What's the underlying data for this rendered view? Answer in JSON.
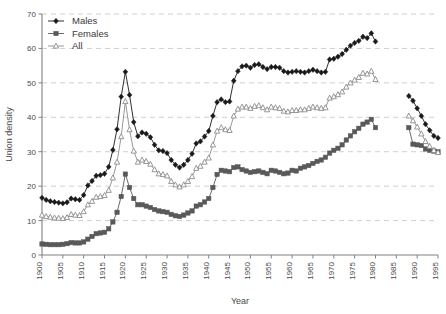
{
  "chart_data": {
    "type": "line",
    "title": "",
    "xlabel": "Year",
    "ylabel": "Union density",
    "xlim": [
      1900,
      1995
    ],
    "ylim": [
      0,
      70
    ],
    "xticks": [
      1900,
      1905,
      1910,
      1915,
      1920,
      1925,
      1930,
      1935,
      1940,
      1945,
      1950,
      1955,
      1960,
      1965,
      1970,
      1975,
      1980,
      1985,
      1990,
      1995
    ],
    "yticks": [
      0,
      10,
      20,
      30,
      40,
      50,
      60,
      70
    ],
    "grid": "horizontal-dashed",
    "legend_position": "top-left",
    "series": [
      {
        "name": "Males",
        "marker": "diamond",
        "color": "#1a1a1a",
        "x": [
          1900,
          1901,
          1902,
          1903,
          1904,
          1905,
          1906,
          1907,
          1908,
          1909,
          1910,
          1911,
          1912,
          1913,
          1914,
          1915,
          1916,
          1917,
          1918,
          1919,
          1920,
          1921,
          1922,
          1923,
          1924,
          1925,
          1926,
          1927,
          1928,
          1929,
          1930,
          1931,
          1932,
          1933,
          1934,
          1935,
          1936,
          1937,
          1938,
          1939,
          1940,
          1941,
          1942,
          1943,
          1944,
          1945,
          1946,
          1947,
          1948,
          1949,
          1950,
          1951,
          1952,
          1953,
          1954,
          1955,
          1956,
          1957,
          1958,
          1959,
          1960,
          1961,
          1962,
          1963,
          1964,
          1965,
          1966,
          1967,
          1968,
          1969,
          1970,
          1971,
          1972,
          1973,
          1974,
          1975,
          1976,
          1977,
          1978,
          1979,
          1980,
          1988,
          1989,
          1990,
          1991,
          1992,
          1993,
          1994,
          1995
        ],
        "values": [
          16.6,
          16.0,
          15.6,
          15.4,
          15.2,
          15.0,
          15.3,
          16.4,
          16.2,
          16.0,
          17.4,
          20.2,
          21.5,
          23.0,
          23.2,
          23.6,
          25.6,
          30.5,
          36.5,
          46.0,
          53.2,
          46.5,
          38.6,
          34.5,
          35.6,
          35.2,
          34.2,
          32.0,
          30.4,
          30.2,
          29.6,
          27.6,
          26.2,
          25.4,
          26.2,
          27.6,
          29.4,
          32.4,
          33.0,
          34.4,
          36.0,
          40.4,
          44.4,
          45.2,
          44.4,
          44.6,
          50.6,
          53.4,
          54.8,
          55.0,
          54.4,
          55.2,
          55.4,
          54.6,
          54.0,
          54.6,
          54.6,
          54.4,
          53.4,
          53.0,
          53.2,
          53.4,
          53.2,
          53.0,
          53.4,
          53.8,
          53.4,
          53.0,
          53.2,
          56.8,
          57.0,
          57.6,
          58.4,
          59.6,
          60.8,
          61.6,
          62.2,
          63.4,
          63.0,
          64.4,
          62.0,
          46.2,
          44.8,
          42.6,
          40.4,
          38.0,
          36.2,
          34.6,
          34.0
        ]
      },
      {
        "name": "Females",
        "marker": "square",
        "color": "#595959",
        "x": [
          1900,
          1901,
          1902,
          1903,
          1904,
          1905,
          1906,
          1907,
          1908,
          1909,
          1910,
          1911,
          1912,
          1913,
          1914,
          1915,
          1916,
          1917,
          1918,
          1919,
          1920,
          1921,
          1922,
          1923,
          1924,
          1925,
          1926,
          1927,
          1928,
          1929,
          1930,
          1931,
          1932,
          1933,
          1934,
          1935,
          1936,
          1937,
          1938,
          1939,
          1940,
          1941,
          1942,
          1943,
          1944,
          1945,
          1946,
          1947,
          1948,
          1949,
          1950,
          1951,
          1952,
          1953,
          1954,
          1955,
          1956,
          1957,
          1958,
          1959,
          1960,
          1961,
          1962,
          1963,
          1964,
          1965,
          1966,
          1967,
          1968,
          1969,
          1970,
          1971,
          1972,
          1973,
          1974,
          1975,
          1976,
          1977,
          1978,
          1979,
          1980,
          1988,
          1989,
          1990,
          1991,
          1992,
          1993,
          1994,
          1995
        ],
        "values": [
          3.2,
          3.1,
          3.0,
          3.0,
          3.0,
          3.1,
          3.3,
          3.6,
          3.5,
          3.5,
          3.8,
          4.6,
          5.4,
          6.2,
          6.4,
          6.6,
          7.6,
          9.6,
          12.4,
          17.0,
          23.5,
          19.6,
          16.4,
          14.6,
          14.6,
          14.2,
          13.8,
          13.2,
          12.8,
          12.6,
          12.4,
          11.8,
          11.4,
          11.2,
          11.6,
          12.2,
          12.8,
          14.2,
          14.6,
          15.4,
          16.4,
          19.6,
          23.4,
          24.6,
          24.4,
          24.2,
          25.4,
          25.6,
          24.8,
          24.4,
          24.0,
          24.2,
          24.4,
          24.0,
          23.6,
          24.6,
          24.4,
          24.0,
          23.6,
          23.8,
          24.6,
          24.4,
          25.2,
          25.6,
          26.0,
          26.6,
          27.2,
          27.6,
          28.4,
          29.6,
          30.4,
          31.0,
          32.0,
          33.4,
          34.6,
          35.8,
          36.8,
          38.0,
          38.6,
          39.4,
          37.0,
          37.0,
          32.2,
          32.0,
          31.8,
          30.8,
          30.4,
          30.2,
          30.0
        ]
      },
      {
        "name": "All",
        "marker": "triangle-open",
        "color": "#8c8c8c",
        "x": [
          1900,
          1901,
          1902,
          1903,
          1904,
          1905,
          1906,
          1907,
          1908,
          1909,
          1910,
          1911,
          1912,
          1913,
          1914,
          1915,
          1916,
          1917,
          1918,
          1919,
          1920,
          1921,
          1922,
          1923,
          1924,
          1925,
          1926,
          1927,
          1928,
          1929,
          1930,
          1931,
          1932,
          1933,
          1934,
          1935,
          1936,
          1937,
          1938,
          1939,
          1940,
          1941,
          1942,
          1943,
          1944,
          1945,
          1946,
          1947,
          1948,
          1949,
          1950,
          1951,
          1952,
          1953,
          1954,
          1955,
          1956,
          1957,
          1958,
          1959,
          1960,
          1961,
          1962,
          1963,
          1964,
          1965,
          1966,
          1967,
          1968,
          1969,
          1970,
          1971,
          1972,
          1973,
          1974,
          1975,
          1976,
          1977,
          1978,
          1979,
          1980,
          1988,
          1989,
          1990,
          1991,
          1992,
          1993,
          1994,
          1995
        ],
        "values": [
          11.6,
          11.2,
          11.0,
          10.8,
          10.7,
          10.6,
          10.9,
          11.8,
          11.6,
          11.5,
          12.6,
          14.6,
          15.6,
          16.8,
          17.0,
          17.3,
          18.8,
          22.4,
          27.0,
          34.4,
          44.6,
          36.4,
          30.2,
          27.0,
          27.6,
          27.2,
          26.4,
          24.8,
          23.6,
          23.4,
          23.0,
          21.4,
          20.4,
          19.8,
          20.4,
          21.4,
          22.8,
          25.2,
          25.8,
          27.0,
          28.2,
          32.0,
          36.0,
          37.0,
          36.4,
          36.2,
          40.4,
          42.4,
          43.0,
          43.0,
          42.6,
          43.2,
          43.4,
          42.8,
          42.2,
          43.0,
          42.8,
          42.6,
          41.8,
          41.6,
          42.0,
          42.0,
          42.2,
          42.2,
          42.6,
          43.0,
          42.8,
          42.6,
          42.8,
          45.6,
          46.0,
          46.6,
          47.4,
          48.8,
          50.0,
          50.8,
          51.6,
          52.8,
          52.6,
          53.4,
          51.0,
          40.4,
          39.0,
          37.2,
          35.2,
          33.0,
          31.6,
          30.4,
          29.8
        ]
      }
    ]
  }
}
